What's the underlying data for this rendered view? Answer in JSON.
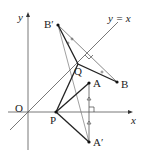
{
  "diagram": {
    "labels": {
      "y_axis": "y",
      "x_axis": "x",
      "origin": "O",
      "line": "y = x",
      "B_prime": "B′",
      "B": "B",
      "Q": "Q",
      "A": "A",
      "P": "P",
      "A_prime": "A′"
    },
    "colors": {
      "line": "#222222",
      "thin": "#666666",
      "background": "#ffffff"
    }
  }
}
